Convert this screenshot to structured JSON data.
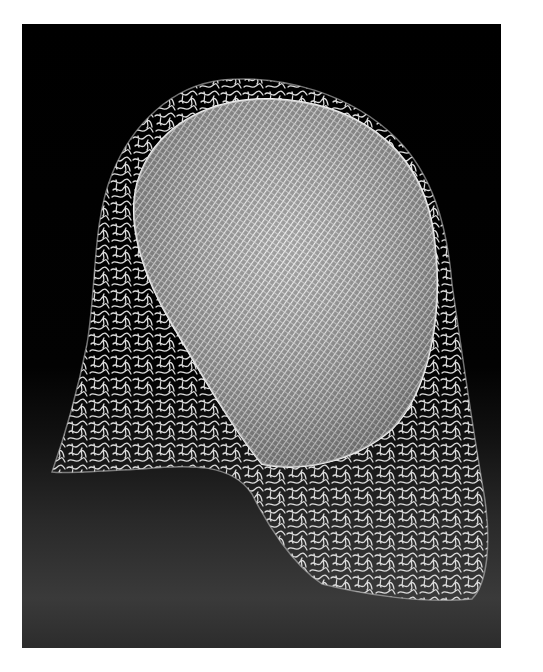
{
  "image": {
    "subject": "glass wire sculpture",
    "description": "Black-and-white photograph of a translucent glass sculpture: an oval panel of fine crosshatched grid lines framed by a draping, tangled squiggle-mesh of glass threads, set against a black background fading to a dark grey floor.",
    "colors": {
      "border": "#ffffff",
      "background_top": "#000000",
      "floor": "#3a3a3a",
      "glass": "#e6e6e6"
    }
  }
}
